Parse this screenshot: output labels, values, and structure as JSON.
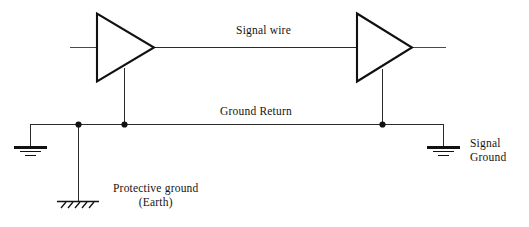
{
  "diagram": {
    "colors": {
      "line": "#2b2b2b",
      "amplifier_outline": "#111111",
      "text": "#151515",
      "background": "#ffffff"
    },
    "labels": {
      "signal_wire": "Signal wire",
      "ground_return": "Ground Return",
      "signal_ground_line1": "Signal",
      "signal_ground_line2": "Ground",
      "protective_ground_line1": "Protective ground",
      "protective_ground_line2": "(Earth)"
    },
    "components": [
      {
        "name": "amplifier-left",
        "type": "amplifier-triangle",
        "x": 96,
        "y": 13,
        "width": 59,
        "height": 69
      },
      {
        "name": "amplifier-right",
        "type": "amplifier-triangle",
        "x": 356,
        "y": 13,
        "width": 57,
        "height": 69
      },
      {
        "name": "chassis-ground-left",
        "type": "ground-symbol",
        "x": 30,
        "y": 147
      },
      {
        "name": "chassis-ground-right",
        "type": "ground-symbol",
        "x": 443,
        "y": 147
      },
      {
        "name": "protective-earth",
        "type": "earth-symbol",
        "x": 78,
        "y": 201
      }
    ],
    "nets": [
      {
        "name": "signal-wire-net",
        "label": "Signal wire",
        "y": 47,
        "from_x": 70,
        "to_x": 445
      },
      {
        "name": "ground-return-net",
        "label": "Ground Return",
        "y": 124,
        "from_x": 30,
        "to_x": 443
      }
    ],
    "junctions": [
      {
        "name": "junction-earth-tap",
        "x": 78,
        "y": 124
      },
      {
        "name": "junction-left-amp-ground",
        "x": 124,
        "y": 124
      },
      {
        "name": "junction-right-amp-ground",
        "x": 382,
        "y": 124
      }
    ]
  }
}
